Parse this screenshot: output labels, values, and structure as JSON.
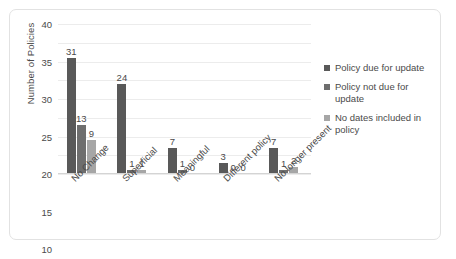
{
  "chart_data": {
    "type": "bar",
    "title": "",
    "xlabel": "",
    "ylabel": "Number of Policies",
    "ylim": [
      0,
      40
    ],
    "ytick_step": 5,
    "yticks": [
      40,
      35,
      30,
      25,
      20,
      15,
      10,
      5,
      0
    ],
    "grid": true,
    "legend_position": "right",
    "categories": [
      "No Change",
      "Superficial",
      "Meaningful",
      "Different policy",
      "No longer present"
    ],
    "series": [
      {
        "name": "Policy due for update",
        "color": "#595959",
        "values": [
          31,
          24,
          7,
          3,
          7
        ]
      },
      {
        "name": "Policy not due for update",
        "color": "#6e6e6e",
        "values": [
          13,
          1,
          1,
          0,
          1
        ]
      },
      {
        "name": "No dates included in policy",
        "color": "#a6a6a6",
        "values": [
          9,
          1,
          0,
          0,
          2
        ]
      }
    ]
  },
  "style": {
    "background": "#ffffff",
    "border": "#e2e2e2",
    "gridline": "#ececec",
    "axis": "#d4d4d4",
    "text": "#4a4a4a"
  }
}
